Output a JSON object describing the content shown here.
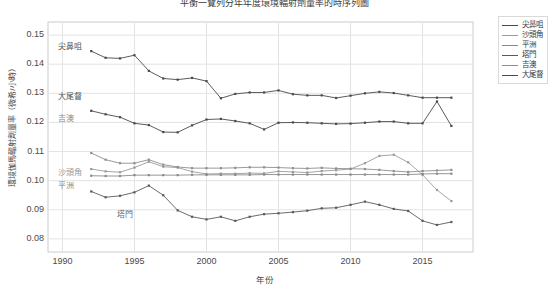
{
  "chart_data": {
    "type": "line",
    "title": "平衡一覽列分年年度環境輻射劑量率的時序列圖",
    "xlabel": "年份",
    "ylabel": "環境伽馬輻射劑量率（微希/小時）",
    "xlim": [
      1989.0,
      2018.5
    ],
    "ylim": [
      0.0755,
      0.1545
    ],
    "grid": true,
    "legend_position": "outside-right-top",
    "xticks": [
      1990,
      1995,
      2000,
      2005,
      2010,
      2015
    ],
    "yticks": [
      0.08,
      0.09,
      0.1,
      0.11,
      0.12,
      0.13,
      0.14,
      0.15
    ],
    "x": [
      1992,
      1993,
      1994,
      1995,
      1996,
      1997,
      1998,
      1999,
      2000,
      2001,
      2002,
      2003,
      2004,
      2005,
      2006,
      2007,
      2008,
      2009,
      2010,
      2011,
      2012,
      2013,
      2014,
      2015,
      2016,
      2017
    ],
    "series": [
      {
        "name": "尖鼻咀",
        "color": "#4a4a4a",
        "values": [
          0.1445,
          0.1422,
          0.142,
          0.1431,
          0.1377,
          0.1351,
          0.1347,
          0.1353,
          0.1342,
          0.1283,
          0.1298,
          0.1303,
          0.1303,
          0.131,
          0.1297,
          0.1293,
          0.1293,
          0.1284,
          0.1292,
          0.13,
          0.1305,
          0.1301,
          0.1293,
          0.1285,
          0.1285,
          0.1285
        ]
      },
      {
        "name": "沙頭角",
        "color": "#9a9a9a",
        "values": [
          0.104,
          0.1032,
          0.1029,
          0.1045,
          0.1065,
          0.1048,
          0.1045,
          0.1031,
          0.1023,
          0.1024,
          0.1024,
          0.1026,
          0.1025,
          0.1032,
          0.103,
          0.1028,
          0.1033,
          0.1036,
          0.104,
          0.106,
          0.1085,
          0.1089,
          0.1063,
          0.102,
          0.0968,
          0.093
        ]
      },
      {
        "name": "平洲",
        "color": "#8a8a8a",
        "values": [
          0.1017,
          0.1016,
          0.1016,
          0.1019,
          0.1019,
          0.1019,
          0.1019,
          0.102,
          0.102,
          0.102,
          0.102,
          0.102,
          0.1021,
          0.1021,
          0.1021,
          0.1021,
          0.1021,
          0.1021,
          0.1021,
          0.1021,
          0.1021,
          0.1021,
          0.1021,
          0.1023,
          0.1024,
          0.1024
        ]
      },
      {
        "name": "塔門",
        "color": "#5a5a5a",
        "values": [
          0.0963,
          0.0943,
          0.0948,
          0.096,
          0.0983,
          0.095,
          0.0898,
          0.0876,
          0.0867,
          0.0876,
          0.0862,
          0.0876,
          0.0885,
          0.0888,
          0.0892,
          0.0897,
          0.0905,
          0.0907,
          0.0917,
          0.0928,
          0.0917,
          0.0903,
          0.0896,
          0.0862,
          0.0848,
          0.0858
        ]
      },
      {
        "name": "吉澳",
        "color": "#8f8f8f",
        "values": [
          0.1095,
          0.1072,
          0.106,
          0.106,
          0.1072,
          0.1055,
          0.1047,
          0.1043,
          0.1043,
          0.1043,
          0.1044,
          0.1046,
          0.1046,
          0.1045,
          0.1043,
          0.1042,
          0.1044,
          0.1042,
          0.1041,
          0.104,
          0.1037,
          0.1033,
          0.103,
          0.1033,
          0.1035,
          0.1037
        ]
      },
      {
        "name": "大尾督",
        "color": "#4a4a4a",
        "values": [
          0.124,
          0.1228,
          0.1218,
          0.1197,
          0.1191,
          0.1167,
          0.1166,
          0.119,
          0.121,
          0.1212,
          0.1205,
          0.1197,
          0.1176,
          0.1199,
          0.12,
          0.1199,
          0.1197,
          0.1195,
          0.1196,
          0.1199,
          0.1203,
          0.1203,
          0.1197,
          0.1197,
          0.1272,
          0.1188
        ]
      }
    ],
    "annotations": [
      {
        "text": "尖鼻咀",
        "x_px": 58,
        "y_px": 40,
        "color": "#555555"
      },
      {
        "text": "大尾督",
        "x_px": 58,
        "y_px": 90,
        "color": "#555555"
      },
      {
        "text": "吉澳",
        "x_px": 58,
        "y_px": 112,
        "color": "#8a8a8a"
      },
      {
        "text": "沙頭角",
        "x_px": 58,
        "y_px": 166,
        "color": "#9a9a9a"
      },
      {
        "text": "平洲",
        "x_px": 58,
        "y_px": 179,
        "color": "#8a8a8a"
      },
      {
        "text": "塔門",
        "x_px": 117,
        "y_px": 208,
        "color": "#6a6a6a"
      }
    ],
    "legend_entries": [
      "尖鼻咀",
      "沙頭角",
      "平洲",
      "塔門",
      "吉澳",
      "大尾督"
    ]
  }
}
